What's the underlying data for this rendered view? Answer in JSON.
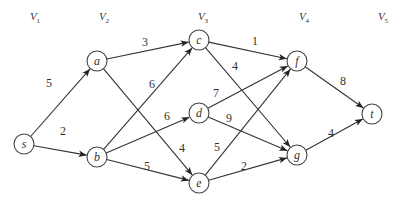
{
  "diagram": {
    "type": "directed-weighted-graph",
    "levels": [
      {
        "label": "V",
        "sub": "1",
        "x": 35
      },
      {
        "label": "V",
        "sub": "2",
        "x": 104
      },
      {
        "label": "V",
        "sub": "3",
        "x": 203
      },
      {
        "label": "V",
        "sub": "4",
        "x": 304
      },
      {
        "label": "V",
        "sub": "5",
        "x": 383
      }
    ],
    "nodes": [
      {
        "id": "s",
        "label": "s",
        "x": 24,
        "y": 144
      },
      {
        "id": "a",
        "label": "a",
        "x": 97,
        "y": 61
      },
      {
        "id": "b",
        "label": "b",
        "x": 97,
        "y": 157
      },
      {
        "id": "c",
        "label": "c",
        "x": 199,
        "y": 40
      },
      {
        "id": "d",
        "label": "d",
        "x": 199,
        "y": 113
      },
      {
        "id": "e",
        "label": "e",
        "x": 199,
        "y": 183
      },
      {
        "id": "f",
        "label": "f",
        "x": 297,
        "y": 61
      },
      {
        "id": "g",
        "label": "g",
        "x": 297,
        "y": 155
      },
      {
        "id": "t",
        "label": "t",
        "x": 372,
        "y": 114
      }
    ],
    "edges": [
      {
        "from": "s",
        "to": "a",
        "weight": "5",
        "lx": 49,
        "ly": 87
      },
      {
        "from": "s",
        "to": "b",
        "weight": "2",
        "lx": 63,
        "ly": 135
      },
      {
        "from": "a",
        "to": "c",
        "weight": "3",
        "lx": 145,
        "ly": 46
      },
      {
        "from": "a",
        "to": "e",
        "weight": "4",
        "lx": 182,
        "ly": 152
      },
      {
        "from": "b",
        "to": "c",
        "weight": "6",
        "lx": 152,
        "ly": 88
      },
      {
        "from": "b",
        "to": "d",
        "weight": "6",
        "lx": 167,
        "ly": 120
      },
      {
        "from": "b",
        "to": "e",
        "weight": "5",
        "lx": 147,
        "ly": 170
      },
      {
        "from": "c",
        "to": "f",
        "weight": "1",
        "lx": 255,
        "ly": 45
      },
      {
        "from": "c",
        "to": "g",
        "weight": "4",
        "lx": 235,
        "ly": 70
      },
      {
        "from": "d",
        "to": "f",
        "weight": "7",
        "lx": 216,
        "ly": 97
      },
      {
        "from": "d",
        "to": "g",
        "weight": "9",
        "lx": 229,
        "ly": 122
      },
      {
        "from": "e",
        "to": "f",
        "weight": "5",
        "lx": 217,
        "ly": 151
      },
      {
        "from": "e",
        "to": "g",
        "weight": "2",
        "lx": 244,
        "ly": 170
      },
      {
        "from": "f",
        "to": "t",
        "weight": "8",
        "lx": 343,
        "ly": 85
      },
      {
        "from": "g",
        "to": "t",
        "weight": "4",
        "lx": 331,
        "ly": 137
      }
    ],
    "node_radius": 10,
    "colors": {
      "stroke": "#333333",
      "background": "#ffffff"
    }
  }
}
